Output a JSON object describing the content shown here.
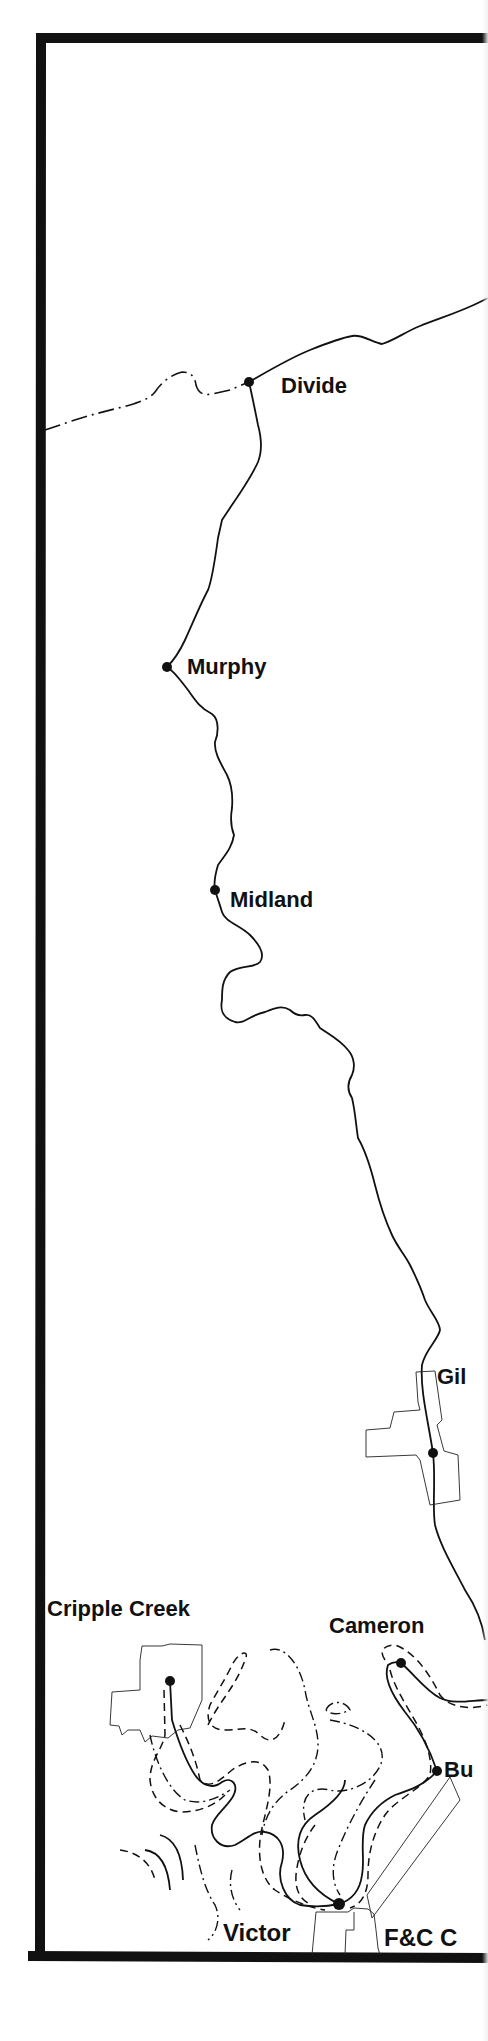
{
  "map": {
    "title": "Midland Terminal / Colorado Midland route map (Divide to Cripple Creek district)",
    "colors": {
      "ink": "#111111",
      "paper": "#ffffff"
    },
    "legend_lines": {
      "solid": "railroad line",
      "dashed": "other railroad line",
      "dash_dot": "other railroad line",
      "thin_outline": "town boundary"
    },
    "stations": [
      {
        "id": "divide",
        "label": "Divide",
        "x": 249,
        "y": 382
      },
      {
        "id": "murphy",
        "label": "Murphy",
        "x": 167,
        "y": 667
      },
      {
        "id": "midland",
        "label": "Midland",
        "x": 215,
        "y": 890
      },
      {
        "id": "gillett",
        "label": "Gil",
        "x": 433,
        "y": 1453
      },
      {
        "id": "cameron",
        "label": "Cameron",
        "x": 401,
        "y": 1663
      },
      {
        "id": "bull-hill",
        "label": "Bu",
        "x": 437,
        "y": 1771
      },
      {
        "id": "cripple-creek",
        "label": "Cripple Creek",
        "x": 170,
        "y": 1681
      },
      {
        "id": "victor",
        "label": "Victor",
        "x": 339,
        "y": 1904
      }
    ],
    "labels": {
      "divide": "Divide",
      "murphy": "Murphy",
      "midland": "Midland",
      "gillett": "Gil",
      "cripple_creek": "Cripple Creek",
      "cameron": "Cameron",
      "bull_hill": "Bu",
      "victor": "Victor",
      "fcc": "F&C C"
    }
  }
}
